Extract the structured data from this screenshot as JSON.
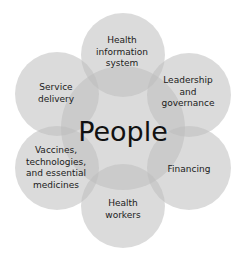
{
  "diagram": {
    "center": "People",
    "nodes": [
      {
        "id": "health-information-system",
        "label": "Health\ninformation\nsystem"
      },
      {
        "id": "leadership-governance",
        "label": "Leadership\nand\ngovernance"
      },
      {
        "id": "financing",
        "label": "Financing"
      },
      {
        "id": "health-workers",
        "label": "Health\nworkers"
      },
      {
        "id": "vaccines-technologies-medicines",
        "label": "Vaccines,\ntechnologies,\nand essential\nmedicines"
      },
      {
        "id": "service-delivery",
        "label": "Service\ndelivery"
      }
    ],
    "colors": {
      "circle_fill": "#b9b9b9",
      "circle_opacity": 0.55,
      "text": "#1a1a1a"
    }
  }
}
